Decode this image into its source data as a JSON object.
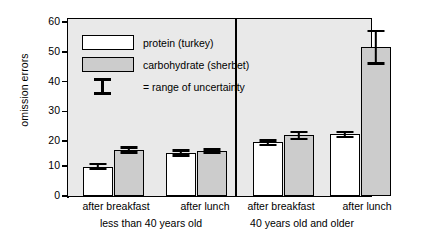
{
  "chart_data": {
    "type": "bar",
    "title": "",
    "xlabel": "",
    "ylabel": "omission errors",
    "ylim": [
      0,
      60
    ],
    "yticks": [
      0,
      10,
      20,
      30,
      40,
      50,
      60
    ],
    "grid": false,
    "legend_position": "inside-top-left",
    "panels": [
      {
        "name": "less than 40 years old",
        "categories": [
          "after breakfast",
          "after lunch"
        ]
      },
      {
        "name": "40 years old and older",
        "categories": [
          "after breakfast",
          "after lunch"
        ]
      }
    ],
    "categories": [
      "after breakfast (less than 40 years old)",
      "after lunch (less than 40 years old)",
      "after breakfast (40 years old and older)",
      "after lunch (40 years old and older)"
    ],
    "series": [
      {
        "name": "protein (turkey)",
        "color": "#ffffff",
        "values": [
          10.0,
          14.7,
          18.3,
          21.0
        ],
        "err_low": [
          8.7,
          13.3,
          17.0,
          19.7
        ],
        "err_high": [
          11.3,
          16.0,
          19.3,
          22.3
        ]
      },
      {
        "name": "carbohydrate (sherbet)",
        "color": "#cccccc",
        "values": [
          15.7,
          15.2,
          20.7,
          50.7
        ],
        "err_low": [
          14.3,
          14.3,
          19.0,
          44.7
        ],
        "err_high": [
          17.0,
          16.3,
          22.3,
          56.7
        ]
      }
    ],
    "annotations": [
      "= range of uncertainty"
    ]
  },
  "axis": {
    "y_title": "omission errors",
    "y_tick_labels": [
      "60",
      "50",
      "40",
      "30",
      "20",
      "10",
      "0"
    ]
  },
  "legend": {
    "items": [
      {
        "label": "protein (turkey)",
        "swatch": "white-square"
      },
      {
        "label": "carbohydrate (sherbet)",
        "swatch": "gray-square"
      },
      {
        "label": "= range of uncertainty",
        "swatch": "error-bar-symbol"
      }
    ]
  },
  "x_axis": {
    "group_labels": [
      "after breakfast",
      "after lunch",
      "after breakfast",
      "after lunch"
    ],
    "panel_labels": [
      "less than 40 years old",
      "40 years old and older"
    ]
  },
  "colors": {
    "plot_background": "#e9e9e9",
    "protein_fill": "#ffffff",
    "carbohydrate_fill": "#cccccc",
    "ink": "#000000",
    "page_background": "#ffffff"
  }
}
